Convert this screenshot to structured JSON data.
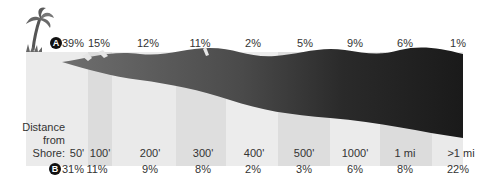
{
  "legend": {
    "series_a_badge": "A",
    "series_b_badge": "B"
  },
  "axis": {
    "title_line1": "Distance",
    "title_line2": "from",
    "title_line3": "Shore:"
  },
  "columns": [
    {
      "distance": "50'",
      "a": "39%",
      "b": "31%"
    },
    {
      "distance": "100'",
      "a": "15%",
      "b": "11%"
    },
    {
      "distance": "200'",
      "a": "12%",
      "b": "9%"
    },
    {
      "distance": "300'",
      "a": "11%",
      "b": "8%"
    },
    {
      "distance": "400'",
      "a": "2%",
      "b": "2%"
    },
    {
      "distance": "500'",
      "a": "5%",
      "b": "3%"
    },
    {
      "distance": "1000'",
      "a": "9%",
      "b": "6%"
    },
    {
      "distance": "1 mi",
      "a": "6%",
      "b": "8%"
    },
    {
      "distance": ">1 mi",
      "a": "1%",
      "b": "22%"
    }
  ],
  "colors": {
    "water_light": "#6e6e6e",
    "water_dark": "#1e1e1e",
    "sand": "#e6e6e6",
    "sand_band": "#d9d9d9",
    "badge": "#111111"
  }
}
